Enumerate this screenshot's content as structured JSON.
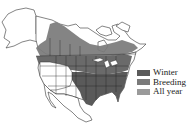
{
  "map": {
    "region": "North America",
    "colors": {
      "background": "#ffffff",
      "land": "#ffffff",
      "outline": "#333333",
      "winter": "#5a5a5a",
      "breeding": "#7a7a7a",
      "all_year": "#9a9a9a"
    }
  },
  "legend": {
    "items": [
      {
        "label": "Winter",
        "color": "#5a5a5a"
      },
      {
        "label": "Breeding",
        "color": "#7a7a7a"
      },
      {
        "label": "All year",
        "color": "#9a9a9a"
      }
    ]
  }
}
